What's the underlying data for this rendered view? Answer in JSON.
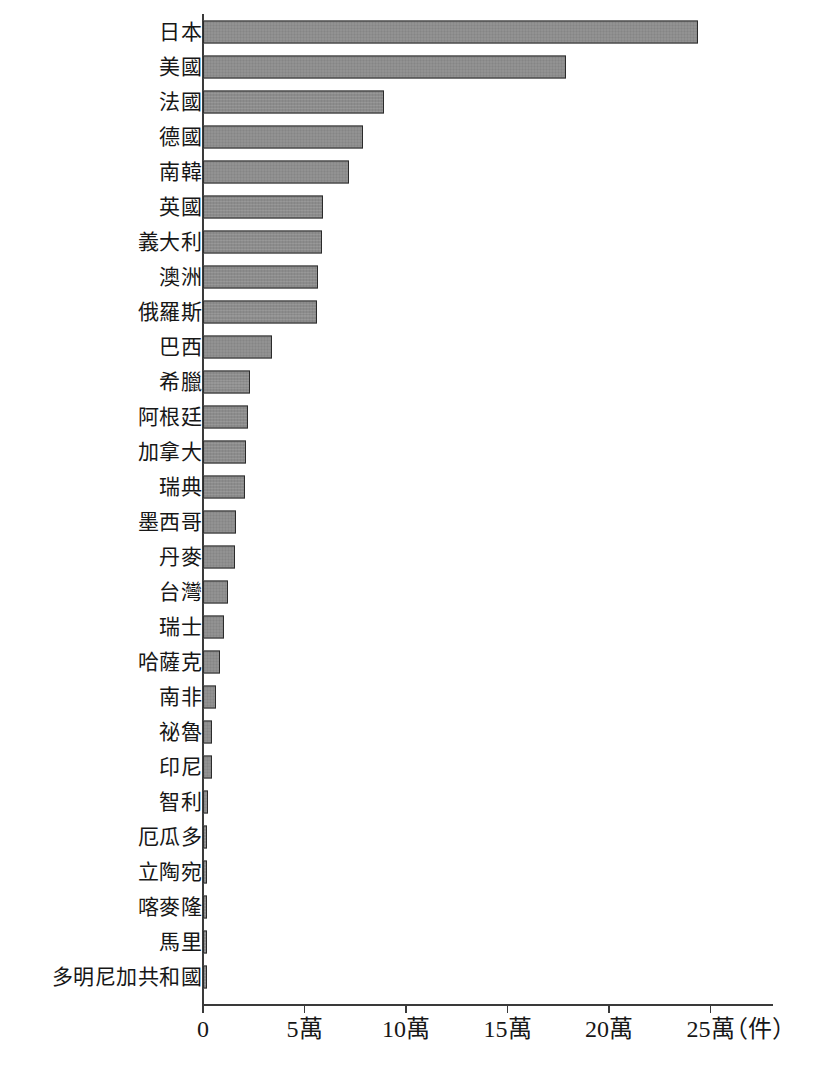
{
  "chart_data": {
    "type": "bar",
    "orientation": "horizontal",
    "title": "",
    "subtitle": "",
    "xlabel": "",
    "ylabel": "",
    "unit_label": "（件）",
    "xlim": [
      0,
      27.5
    ],
    "grid": false,
    "legend": null,
    "axis_tick_labels": [
      "0",
      "5萬",
      "10萬",
      "15萬",
      "20萬",
      "25萬"
    ],
    "axis_tick_values": [
      0,
      5,
      10,
      15,
      20,
      25
    ],
    "value_unit": "萬件",
    "bar_fill_color": "#8c8c8c",
    "bar_border_color": "#2b2b2b",
    "axis_color": "#3a3a3a",
    "categories": [
      "日本",
      "美國",
      "法國",
      "德國",
      "南韓",
      "英國",
      "義大利",
      "澳洲",
      "俄羅斯",
      "巴西",
      "希臘",
      "阿根廷",
      "加拿大",
      "瑞典",
      "墨西哥",
      "丹麥",
      "台灣",
      "瑞士",
      "哈薩克",
      "南非",
      "祕魯",
      "印尼",
      "智利",
      "厄瓜多",
      "立陶宛",
      "喀麥隆",
      "馬里",
      "多明尼加共和國"
    ],
    "values": [
      24.4,
      17.9,
      8.9,
      7.9,
      7.2,
      5.9,
      5.85,
      5.65,
      5.6,
      3.4,
      2.3,
      2.2,
      2.1,
      2.05,
      1.65,
      1.6,
      1.25,
      1.05,
      0.85,
      0.65,
      0.45,
      0.45,
      0.25,
      0.18,
      0.15,
      0.13,
      0.12,
      0.12
    ]
  }
}
